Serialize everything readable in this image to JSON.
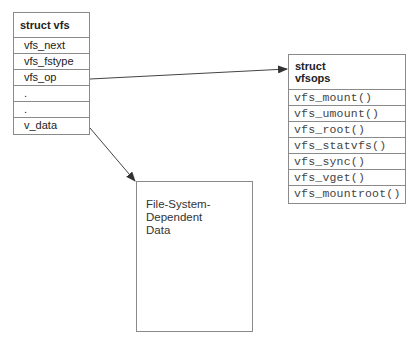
{
  "diagram": {
    "vfs": {
      "title": "struct vfs",
      "fields": [
        "vfs_next",
        "vfs_fstype",
        "vfs_op",
        ".",
        ".",
        "v_data"
      ]
    },
    "vfsops": {
      "title_line1": "struct",
      "title_line2": "vfsops",
      "functions": [
        "vfs_mount()",
        "vfs_umount()",
        "vfs_root()",
        "vfs_statvfs()",
        "vfs_sync()",
        "vfs_vget()",
        "vfs_mountroot()"
      ]
    },
    "fs_data": {
      "label": "File-System-\nDependent\nData"
    },
    "arrows": [
      {
        "from": "vfs.vfs_op",
        "to": "vfsops"
      },
      {
        "from": "vfs.v_data",
        "to": "fs_data"
      }
    ],
    "colors": {
      "border": "#8a8a8a",
      "arrow": "#333333"
    }
  }
}
